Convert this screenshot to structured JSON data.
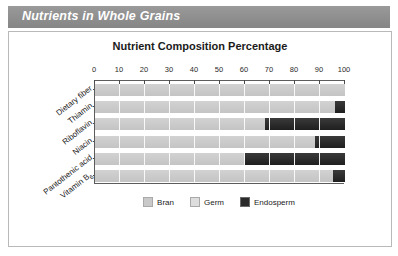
{
  "banner": {
    "title": "Nutrients in Whole Grains"
  },
  "legend": {
    "items": [
      {
        "label": "Bran",
        "color": "#c9c9c9"
      },
      {
        "label": "Germ",
        "color": "#dddddd"
      },
      {
        "label": "Endosperm",
        "color": "#2a2a2a"
      }
    ]
  },
  "chart_data": {
    "type": "bar",
    "title": "Nutrient Composition Percentage",
    "orientation": "horizontal",
    "stacked": true,
    "xlabel": "",
    "ylabel": "",
    "xlim": [
      0,
      100
    ],
    "xticks": [
      0,
      10,
      20,
      30,
      40,
      50,
      60,
      70,
      80,
      90,
      100
    ],
    "xtick_labels": [
      "0",
      "10",
      "20",
      "30",
      "40",
      "50",
      "60",
      "70",
      "80",
      "90",
      "100"
    ],
    "grid": true,
    "axis_position": "top",
    "legend_position": "bottom",
    "categories": [
      "Dietary fiber",
      "Thiamin",
      "Riboflavin",
      "Niacin",
      "Pantothenic acid",
      "Vitamin B6"
    ],
    "category_labels_html": [
      "Dietary fiber",
      "Thiamin",
      "Riboflavin",
      "Niacin",
      "Pantothenic acid",
      "Vitamin B<sub>6</sub>"
    ],
    "series": [
      {
        "name": "Bran",
        "color": "#c9c9c9",
        "values": [
          100,
          96,
          68,
          88,
          60,
          95
        ]
      },
      {
        "name": "Germ",
        "color": "#dddddd",
        "values": [
          0,
          0,
          0,
          0,
          0,
          0
        ]
      },
      {
        "name": "Endosperm",
        "color": "#2a2a2a",
        "values": [
          0,
          4,
          32,
          12,
          40,
          5
        ]
      }
    ]
  }
}
